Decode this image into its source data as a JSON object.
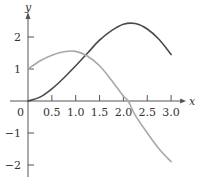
{
  "chart_data": {
    "type": "line",
    "title": "",
    "xlabel": "x",
    "ylabel": "y",
    "xlim": [
      0,
      3.0
    ],
    "ylim": [
      -2,
      2
    ],
    "grid": false,
    "legend": null,
    "origin_label": "0",
    "x_ticks": [
      0.5,
      1.0,
      1.5,
      2.0,
      2.5,
      3.0
    ],
    "x_tick_labels": [
      "0.5",
      "1.0",
      "1.5",
      "2.0",
      "2.5",
      "3.0"
    ],
    "y_ticks": [
      -2,
      -1,
      1,
      2
    ],
    "y_tick_labels": [
      "−2",
      "−1",
      "1",
      "2"
    ],
    "series": [
      {
        "name": "dark-curve",
        "color": "#4a4a4a",
        "x": [
          0,
          0.25,
          0.5,
          0.75,
          1.0,
          1.25,
          1.5,
          1.75,
          2.0,
          2.25,
          2.5,
          2.75,
          3.0
        ],
        "y": [
          0,
          0.12,
          0.38,
          0.72,
          1.1,
          1.5,
          1.9,
          2.2,
          2.4,
          2.42,
          2.25,
          1.92,
          1.45
        ]
      },
      {
        "name": "light-curve",
        "color": "#a8a8a8",
        "x": [
          0,
          0.25,
          0.5,
          0.75,
          1.0,
          1.25,
          1.5,
          1.75,
          2.0,
          2.1,
          2.25,
          2.5,
          2.75,
          3.0
        ],
        "y": [
          1.0,
          1.25,
          1.43,
          1.54,
          1.55,
          1.4,
          1.1,
          0.65,
          0.15,
          0,
          -0.45,
          -1.0,
          -1.5,
          -1.9
        ]
      }
    ]
  }
}
